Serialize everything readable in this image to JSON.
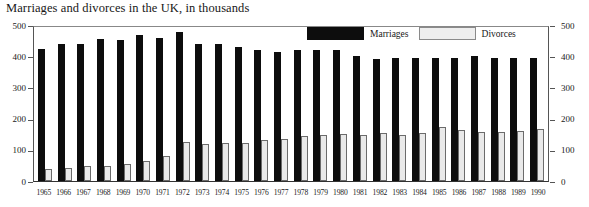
{
  "chart_data": {
    "type": "bar",
    "title": "Marriages and divorces in the UK, in thousands",
    "xlabel": "",
    "ylabel": "",
    "ylim": [
      0,
      500
    ],
    "yticks": [
      0,
      100,
      200,
      300,
      400,
      500
    ],
    "grid": false,
    "legend_position": "top-right",
    "categories": [
      "1965",
      "1966",
      "1967",
      "1968",
      "1969",
      "1970",
      "1971",
      "1972",
      "1973",
      "1974",
      "1975",
      "1976",
      "1977",
      "1978",
      "1979",
      "1980",
      "1981",
      "1982",
      "1983",
      "1984",
      "1985",
      "1986",
      "1987",
      "1988",
      "1989",
      "1990"
    ],
    "series": [
      {
        "name": "Marriages",
        "color": "#0d0d0d",
        "values": [
          428,
          445,
          445,
          462,
          457,
          475,
          465,
          485,
          445,
          445,
          435,
          425,
          420,
          425,
          425,
          425,
          405,
          395,
          400,
          400,
          400,
          400,
          405,
          400,
          400,
          400
        ]
      },
      {
        "name": "Divorces",
        "color": "#e9e9e9",
        "values": [
          40,
          42,
          48,
          50,
          56,
          65,
          80,
          128,
          120,
          123,
          125,
          133,
          135,
          145,
          148,
          153,
          148,
          155,
          150,
          155,
          175,
          165,
          160,
          160,
          163,
          170
        ]
      }
    ]
  },
  "legend": {
    "items": [
      {
        "label": "Marriages"
      },
      {
        "label": "Divorces"
      }
    ]
  },
  "axes": {
    "left_ticks": [
      "500",
      "400",
      "300",
      "200",
      "100",
      "0"
    ],
    "right_ticks": [
      "500",
      "400",
      "300",
      "200",
      "100",
      "0"
    ]
  }
}
